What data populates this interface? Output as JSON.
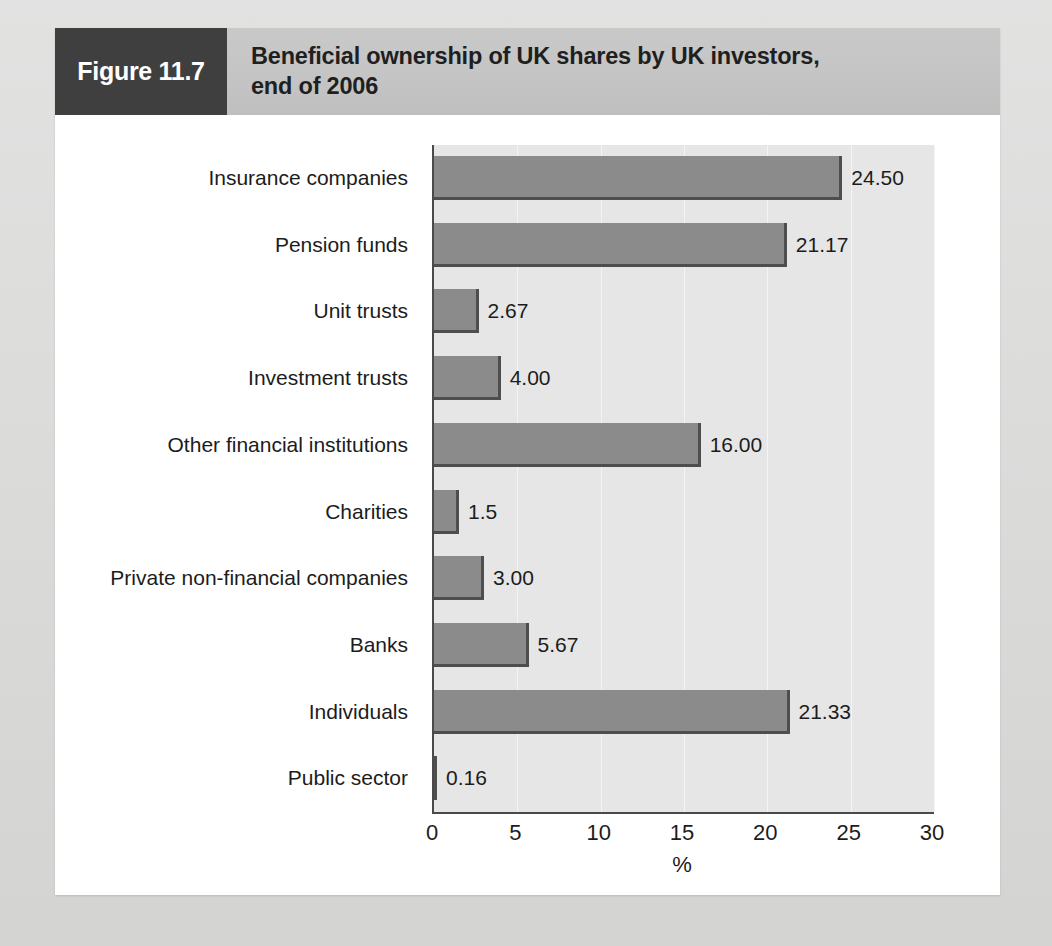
{
  "figure": {
    "tag": "Figure 11.7",
    "title": "Beneficial ownership of UK shares by UK investors,\nend of 2006"
  },
  "colors": {
    "tag_background": "#3f3f3f",
    "header_background": "#c4c4c4",
    "card_background": "#ffffff",
    "page_background": "#d8d8d7",
    "plot_background": "#e6e6e6",
    "bar_fill": "#8b8b8b",
    "bar_shadow": "#4e4e4e",
    "axis_line": "#4a4a4a",
    "gridline": "#f4f4f4",
    "text": "#1c1c1c"
  },
  "chart_data": {
    "type": "bar",
    "orientation": "horizontal",
    "title": "Beneficial ownership of UK shares by UK investors, end of 2006",
    "xlabel": "%",
    "ylabel": "",
    "xlim": [
      0,
      30
    ],
    "xticks": [
      0,
      5,
      10,
      15,
      20,
      25,
      30
    ],
    "xtick_labels": [
      "0",
      "5",
      "10",
      "15",
      "20",
      "25",
      "30"
    ],
    "grid": true,
    "legend": false,
    "categories": [
      "Insurance companies",
      "Pension funds",
      "Unit trusts",
      "Investment trusts",
      "Other financial institutions",
      "Charities",
      "Private non-financial companies",
      "Banks",
      "Individuals",
      "Public sector"
    ],
    "values": [
      24.5,
      21.17,
      2.67,
      4.0,
      16.0,
      1.5,
      3.0,
      5.67,
      21.33,
      0.16
    ],
    "data_labels": [
      "24.50",
      "21.17",
      "2.67",
      "4.00",
      "16.00",
      "1.5",
      "3.00",
      "5.67",
      "21.33",
      "0.16"
    ]
  }
}
